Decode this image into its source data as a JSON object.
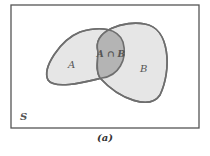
{
  "diagram": {
    "type": "venn",
    "sets": [
      {
        "id": "A",
        "label": "A"
      },
      {
        "id": "B",
        "label": "B"
      }
    ],
    "intersection_label": "A ∩ B",
    "universe_label": "S",
    "caption": "(a)",
    "colors": {
      "outline": "#6e6e6e",
      "set_fill": "#e6e6e6",
      "intersection_fill": "#b4b4b4",
      "frame": "#555555"
    }
  }
}
